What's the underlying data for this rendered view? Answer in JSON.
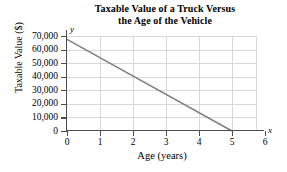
{
  "chart_data": {
    "type": "line",
    "title": "Taxable Value of a Truck Versus the Age of the Vehicle",
    "title_lines": [
      "Taxable Value of a Truck Versus",
      "the Age of the Vehicle"
    ],
    "xlabel": "Age (years)",
    "ylabel": "Taxable Value ($)",
    "x_axis_letter": "y",
    "y_axis_letter": "x",
    "axis_letters": {
      "x": "x",
      "y": "y"
    },
    "xlim": [
      0,
      6
    ],
    "ylim": [
      0,
      70000
    ],
    "x_ticks": [
      0,
      1,
      2,
      3,
      4,
      5,
      6
    ],
    "x_tick_labels": [
      "0",
      "1",
      "2",
      "3",
      "4",
      "5",
      "6"
    ],
    "y_ticks": [
      0,
      10000,
      20000,
      30000,
      40000,
      50000,
      60000,
      70000
    ],
    "y_tick_labels": [
      "0",
      "10,000",
      "20,000",
      "30,000",
      "40,000",
      "50,000",
      "60,000",
      "70,000"
    ],
    "grid": true,
    "legend": null,
    "series": [
      {
        "name": "Taxable value",
        "points": [
          {
            "x": 0,
            "y": 67500
          },
          {
            "x": 5,
            "y": 0
          }
        ],
        "color": "#808080"
      }
    ]
  },
  "colors": {
    "line": "#808080",
    "grid": "#d9d9d9",
    "axis": "#4d4d4d",
    "text": "#000000",
    "background": "#ffffff"
  }
}
